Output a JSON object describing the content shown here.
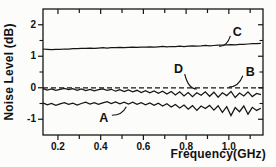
{
  "chart_data": {
    "type": "line",
    "title": "",
    "xlabel": "Frequency(GHz)",
    "ylabel": "Noise Level (dB)",
    "xlim": [
      0.13,
      1.16
    ],
    "ylim": [
      -1.5,
      2.5
    ],
    "grid": false,
    "frame": true,
    "line_color": "#161616",
    "background": "#fcfcfa",
    "x_ticks": {
      "all": [
        0.2,
        0.3,
        0.4,
        0.5,
        0.6,
        0.7,
        0.8,
        0.9,
        1.0,
        1.1
      ],
      "labeled_values": [
        0.2,
        0.4,
        0.6,
        0.8,
        1.0
      ],
      "labels": [
        "0.2",
        "0.4",
        "0.6",
        "0.8",
        "1.0"
      ]
    },
    "y_ticks": {
      "major_values": [
        2,
        1,
        0,
        -1
      ],
      "major_labels": [
        "2",
        "1",
        "0",
        "-1"
      ],
      "minor_values": [
        1.5,
        0.5,
        -0.5
      ]
    },
    "series": [
      {
        "name": "B",
        "style": "dashed",
        "points_x": [
          0.13,
          1.16
        ],
        "points_y": [
          0,
          0
        ]
      },
      {
        "name": "C",
        "style": "solid",
        "x_start": 0.13,
        "x_step": 0.02,
        "y": [
          1.23,
          1.22,
          1.21,
          1.22,
          1.22,
          1.23,
          1.23,
          1.24,
          1.24,
          1.25,
          1.25,
          1.26,
          1.25,
          1.26,
          1.27,
          1.26,
          1.27,
          1.27,
          1.28,
          1.27,
          1.28,
          1.29,
          1.28,
          1.29,
          1.29,
          1.3,
          1.29,
          1.3,
          1.31,
          1.3,
          1.31,
          1.31,
          1.32,
          1.31,
          1.32,
          1.33,
          1.32,
          1.33,
          1.34,
          1.33,
          1.34,
          1.35,
          1.35,
          1.36,
          1.37,
          1.36,
          1.38,
          1.38,
          1.39,
          1.4,
          1.4,
          1.41
        ]
      },
      {
        "name": "D",
        "style": "solid",
        "x_start": 0.13,
        "x_step": 0.02,
        "y": [
          -0.03,
          -0.07,
          -0.04,
          -0.08,
          -0.05,
          -0.02,
          -0.06,
          -0.03,
          -0.08,
          -0.04,
          -0.09,
          -0.05,
          -0.1,
          -0.06,
          -0.04,
          -0.08,
          -0.05,
          -0.11,
          -0.06,
          -0.12,
          -0.07,
          -0.13,
          -0.08,
          -0.15,
          -0.09,
          -0.16,
          -0.1,
          -0.18,
          -0.11,
          -0.2,
          -0.12,
          -0.23,
          -0.13,
          -0.26,
          -0.15,
          -0.28,
          -0.16,
          -0.24,
          -0.13,
          -0.27,
          -0.14,
          -0.3,
          -0.16,
          -0.25,
          -0.12,
          -0.31,
          -0.17,
          -0.26,
          -0.13,
          -0.28,
          -0.18,
          -0.22
        ]
      },
      {
        "name": "A",
        "style": "solid",
        "x_start": 0.13,
        "x_step": 0.02,
        "y": [
          -0.48,
          -0.54,
          -0.5,
          -0.56,
          -0.51,
          -0.47,
          -0.53,
          -0.49,
          -0.55,
          -0.5,
          -0.46,
          -0.52,
          -0.47,
          -0.53,
          -0.48,
          -0.44,
          -0.5,
          -0.45,
          -0.51,
          -0.46,
          -0.52,
          -0.46,
          -0.53,
          -0.47,
          -0.54,
          -0.48,
          -0.56,
          -0.49,
          -0.58,
          -0.51,
          -0.61,
          -0.53,
          -0.64,
          -0.55,
          -0.68,
          -0.57,
          -0.72,
          -0.58,
          -0.66,
          -0.56,
          -0.71,
          -0.57,
          -0.78,
          -0.6,
          -0.88,
          -0.63,
          -0.76,
          -0.58,
          -0.84,
          -0.62,
          -0.72,
          -0.65
        ]
      }
    ],
    "annotations": [
      {
        "label": "A",
        "x": 0.415,
        "y": -0.97,
        "tip_x": 0.52,
        "tip_y": -0.6,
        "bend": "h"
      },
      {
        "label": "D",
        "x": 0.765,
        "y": 0.59,
        "tip_x": 0.85,
        "tip_y": -0.04,
        "bend": "v"
      },
      {
        "label": "B",
        "x": 1.1,
        "y": 0.5,
        "tip_x": 1.0,
        "tip_y": 0.02,
        "bend": "v"
      },
      {
        "label": "C",
        "x": 1.04,
        "y": 1.78,
        "tip_x": 0.955,
        "tip_y": 1.31,
        "bend": "v"
      }
    ]
  }
}
